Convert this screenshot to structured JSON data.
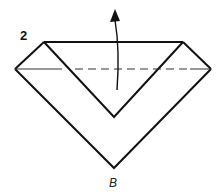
{
  "diagram": {
    "step_number": "2",
    "point_label": "B",
    "stroke_color": "#111111",
    "background": "#ffffff",
    "elements": {
      "top_edge": {
        "x1": 44,
        "y1": 42,
        "x2": 183,
        "y2": 42
      },
      "outer_left_top": {
        "x1": 44,
        "y1": 42,
        "x2": 15,
        "y2": 69
      },
      "outer_right_top": {
        "x1": 183,
        "y1": 42,
        "x2": 211,
        "y2": 69
      },
      "inner_v": {
        "left": [
          44,
          42
        ],
        "bottom": [
          114,
          117
        ],
        "right": [
          183,
          42
        ]
      },
      "outer_v": {
        "left": [
          15,
          69
        ],
        "bottom": [
          114,
          168
        ],
        "right": [
          211,
          69
        ]
      },
      "fold_line": {
        "y": 69,
        "solid_left_end": 62,
        "dash_start": 75,
        "dash_end": 190
      },
      "arrow": {
        "from": [
          117,
          90
        ],
        "to": [
          115,
          12
        ],
        "direction": "up",
        "type": "valley-fold-arrow"
      }
    }
  }
}
